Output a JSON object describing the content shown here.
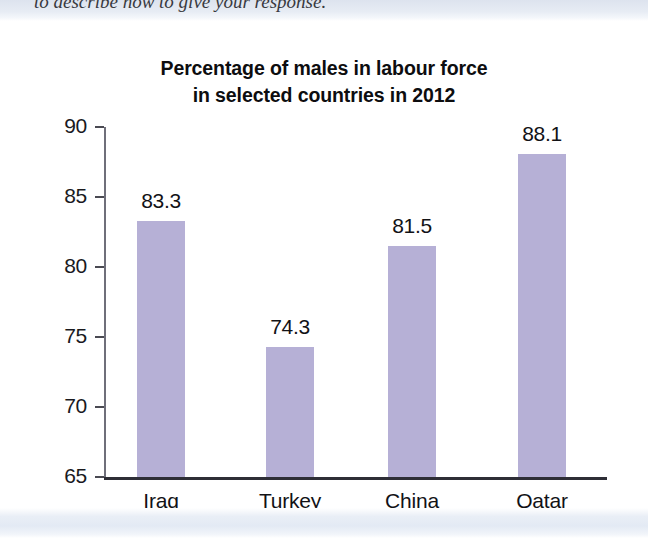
{
  "page": {
    "cropped_text_above": "to describe how to give your response.",
    "background_color": "#ffffff",
    "band_color": "#e4eaf4"
  },
  "chart_data": {
    "type": "bar",
    "title": "Percentage of males in labour force in selected countries in 2012",
    "title_lines": [
      "Percentage of males in labour force",
      "in selected countries in 2012"
    ],
    "categories": [
      "Iraq",
      "Turkey",
      "China",
      "Qatar"
    ],
    "values": [
      83.3,
      74.3,
      81.5,
      88.1
    ],
    "value_labels": [
      "83.3",
      "74.3",
      "81.5",
      "88.1"
    ],
    "xlabel": "",
    "ylabel": "",
    "ylim": [
      65,
      90
    ],
    "yticks": [
      65,
      70,
      75,
      80,
      85,
      90
    ],
    "ytick_labels": [
      "65",
      "70",
      "75",
      "80",
      "85",
      "90"
    ],
    "grid": false,
    "legend": false,
    "bar_color": "#b6b0d6",
    "axis_color": "#2e2e36",
    "text_color": "#121216"
  }
}
